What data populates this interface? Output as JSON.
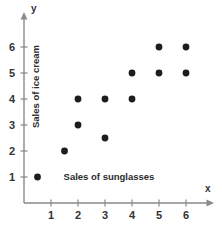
{
  "chart_data": {
    "type": "scatter",
    "title": "",
    "xlabel": "Sales of sunglasses",
    "ylabel": "Sales of ice cream",
    "x_axis_symbol": "x",
    "y_axis_symbol": "y",
    "xlim": [
      0,
      6.8
    ],
    "ylim": [
      0,
      6.8
    ],
    "xticks": [
      1,
      2,
      3,
      4,
      5,
      6
    ],
    "yticks": [
      1,
      2,
      3,
      4,
      5,
      6
    ],
    "xtick_labels": [
      "1",
      "2",
      "3",
      "4",
      "5",
      "6"
    ],
    "ytick_labels": [
      "1",
      "2",
      "3",
      "4",
      "5",
      "6"
    ],
    "grid": false,
    "legend": false,
    "marker": "filled-circle",
    "marker_color": "#1d1d1d",
    "axis_color": "#8a8a8a",
    "points": [
      {
        "x": 0.5,
        "y": 1.0
      },
      {
        "x": 1.5,
        "y": 2.0
      },
      {
        "x": 2.0,
        "y": 3.0
      },
      {
        "x": 2.0,
        "y": 4.0
      },
      {
        "x": 3.0,
        "y": 2.5
      },
      {
        "x": 3.0,
        "y": 4.0
      },
      {
        "x": 4.0,
        "y": 4.0
      },
      {
        "x": 4.0,
        "y": 5.0
      },
      {
        "x": 5.0,
        "y": 5.0
      },
      {
        "x": 5.0,
        "y": 6.0
      },
      {
        "x": 6.0,
        "y": 5.0
      },
      {
        "x": 6.0,
        "y": 6.0
      }
    ]
  }
}
